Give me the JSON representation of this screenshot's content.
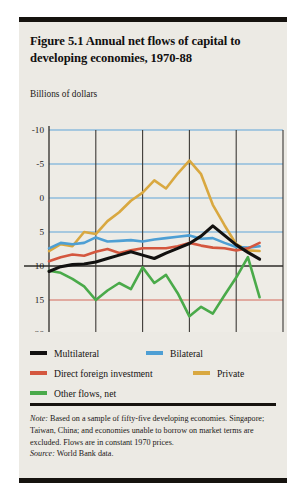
{
  "figure": {
    "title": "Figure 5.1  Annual net flows of capital to developing economies, 1970-88",
    "axis_unit_label": "Billions of dollars",
    "note_label": "Note:",
    "note_text": " Based on a sample of fifty-five developing economies. Singapore; Taiwan, China; and economies unable to borrow on market terms are excluded. Flows are in constant 1970 prices.",
    "source_label": "Source:",
    "source_text": " World Bank data."
  },
  "legend": {
    "items": [
      {
        "label": "Multilateral",
        "color": "#121110"
      },
      {
        "label": "Bilateral",
        "color": "#4e9fd4"
      },
      {
        "label": "Direct foreign investment",
        "color": "#d4573f"
      },
      {
        "label": "Private",
        "color": "#d9a840"
      },
      {
        "label": "Other flows, net",
        "color": "#4aaa4a"
      }
    ]
  },
  "chart_data": {
    "type": "line",
    "title": "Figure 5.1  Annual net flows of capital to developing economies, 1970-88",
    "xlabel": "",
    "ylabel": "Billions of dollars",
    "xlim": [
      1970,
      1990
    ],
    "ylim": [
      -10,
      20
    ],
    "xticks": [
      1970,
      1974,
      1978,
      1982,
      1986,
      1990
    ],
    "yticks": [
      -10,
      -5,
      0,
      5,
      10,
      15,
      20
    ],
    "grid": true,
    "legend_position": "below",
    "x": [
      1970,
      1971,
      1972,
      1973,
      1974,
      1975,
      1976,
      1977,
      1978,
      1979,
      1980,
      1981,
      1982,
      1983,
      1984,
      1985,
      1986,
      1987,
      1988
    ],
    "series": [
      {
        "name": "Multilateral",
        "color": "#121110",
        "values": [
          -0.8,
          -0.1,
          0.2,
          0.3,
          0.6,
          1.1,
          1.6,
          2.1,
          1.6,
          1.1,
          1.9,
          2.6,
          3.3,
          4.4,
          5.9,
          4.5,
          3.1,
          2.0,
          1.0
        ]
      },
      {
        "name": "Bilateral",
        "color": "#4e9fd4",
        "values": [
          2.6,
          3.4,
          3.2,
          3.4,
          4.2,
          3.6,
          3.7,
          3.8,
          3.6,
          3.9,
          4.1,
          4.3,
          4.5,
          4.0,
          4.1,
          3.4,
          2.8,
          2.7,
          2.9
        ]
      },
      {
        "name": "Direct foreign investment",
        "color": "#d4573f",
        "values": [
          0.7,
          1.3,
          1.7,
          1.5,
          2.1,
          2.5,
          1.9,
          2.3,
          2.6,
          2.6,
          2.6,
          2.9,
          3.4,
          3.0,
          2.7,
          2.6,
          2.3,
          2.6,
          3.4
        ]
      },
      {
        "name": "Private",
        "color": "#d9a840",
        "values": [
          2.2,
          3.2,
          2.9,
          5.0,
          4.7,
          6.6,
          7.9,
          9.6,
          10.8,
          12.6,
          11.4,
          13.6,
          15.5,
          13.5,
          9.0,
          6.0,
          3.2,
          2.3,
          2.2
        ]
      },
      {
        "name": "Other flows, net",
        "color": "#4aaa4a",
        "values": [
          -0.7,
          -1.0,
          -1.9,
          -3.0,
          -5.0,
          -3.6,
          -2.5,
          -3.4,
          -0.2,
          -2.5,
          -1.3,
          -4.0,
          -7.4,
          -6.0,
          -7.0,
          -4.3,
          -1.7,
          1.3,
          -4.6
        ]
      }
    ]
  },
  "axes": {
    "y_tick_labels": [
      "20",
      "15",
      "10",
      "5",
      "0",
      "-5",
      "-10"
    ],
    "x_tick_labels": [
      "1970",
      "1974",
      "1978",
      "1982",
      "1986",
      "1990"
    ]
  },
  "colors": {
    "panel_background": "#eceae4",
    "plot_background": "#eeece6",
    "grid_blue": "#5fa4d8",
    "grid_red": "#d4695a",
    "axis_dark": "#3c3a36"
  }
}
